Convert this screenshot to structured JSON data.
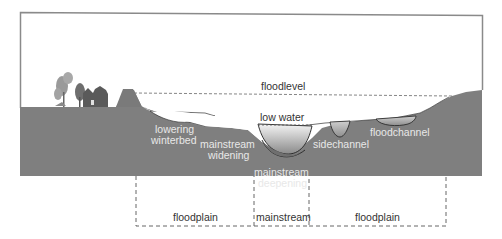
{
  "diagram": {
    "colors": {
      "ground": "#7f7f7f",
      "frame": "#8a8a8a",
      "water_top": "#f2f2f2",
      "water_bottom": "#8c8c8c",
      "label_on_ground": "#e8e8e8",
      "label_on_sky": "#333333",
      "dashed": "#666666"
    },
    "levels": {
      "floodlevel": "floodlevel",
      "low_water": "low water"
    },
    "measures": {
      "lowering_winterbed_1": "lowering",
      "lowering_winterbed_2": "winterbed",
      "mainstream_widening_1": "mainstream",
      "mainstream_widening_2": "widening",
      "mainstream_deepening_1": "mainstream",
      "mainstream_deepening_2": "deepening",
      "sidechannel": "sidechannel",
      "floodchannel": "floodchannel"
    },
    "zones": [
      {
        "label": "floodplain"
      },
      {
        "label": "mainstream"
      },
      {
        "label": "floodplain"
      }
    ],
    "icons": [
      "trees-icon",
      "house-icon",
      "dike-icon"
    ]
  }
}
